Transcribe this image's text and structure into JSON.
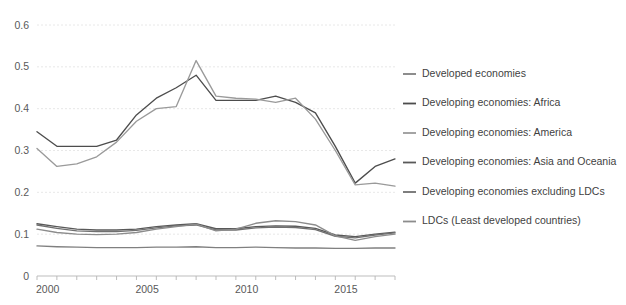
{
  "chart_data": {
    "type": "line",
    "title": "",
    "subtitle": "",
    "xlabel": "",
    "ylabel": "",
    "xlim": [
      2000,
      2018
    ],
    "ylim": [
      0,
      0.6
    ],
    "grid": true,
    "legend_position": "right",
    "x": [
      2000,
      2001,
      2002,
      2003,
      2004,
      2005,
      2006,
      2007,
      2008,
      2009,
      2010,
      2011,
      2012,
      2013,
      2014,
      2015,
      2016,
      2017,
      2018
    ],
    "y_ticks": [
      0,
      0.1,
      0.2,
      0.3,
      0.4,
      0.5,
      0.6
    ],
    "y_tick_labels": [
      "0",
      "0.1",
      "0.2",
      "0.3",
      "0.4",
      "0.5",
      "0.6"
    ],
    "x_ticks": [
      2000,
      2005,
      2010,
      2015
    ],
    "x_tick_labels": [
      "2000",
      "2005",
      "2010",
      "2015"
    ],
    "series": [
      {
        "name": "Developed economies",
        "color": "#808080",
        "values": [
          0.072,
          0.07,
          0.069,
          0.068,
          0.068,
          0.068,
          0.069,
          0.069,
          0.07,
          0.068,
          0.068,
          0.069,
          0.068,
          0.067,
          0.067,
          0.066,
          0.066,
          0.067,
          0.067
        ]
      },
      {
        "name": "Developing economies: Africa",
        "color": "#4d4d4d",
        "values": [
          0.345,
          0.31,
          0.31,
          0.31,
          0.325,
          0.385,
          0.425,
          0.45,
          0.48,
          0.42,
          0.42,
          0.42,
          0.43,
          0.415,
          0.39,
          0.31,
          0.222,
          0.262,
          0.28
        ]
      },
      {
        "name": "Developing economies: America",
        "color": "#9a9a9a",
        "values": [
          0.305,
          0.262,
          0.268,
          0.285,
          0.32,
          0.37,
          0.4,
          0.405,
          0.515,
          0.43,
          0.425,
          0.423,
          0.415,
          0.425,
          0.375,
          0.3,
          0.218,
          0.222,
          0.215
        ]
      },
      {
        "name": "Developing economies: Asia and Oceania",
        "color": "#595959",
        "values": [
          0.125,
          0.118,
          0.112,
          0.11,
          0.11,
          0.112,
          0.118,
          0.122,
          0.125,
          0.113,
          0.113,
          0.118,
          0.12,
          0.119,
          0.114,
          0.098,
          0.094,
          0.1,
          0.105
        ]
      },
      {
        "name": "Developing economies excluding LDCs",
        "color": "#707070",
        "values": [
          0.122,
          0.114,
          0.108,
          0.106,
          0.106,
          0.109,
          0.115,
          0.12,
          0.122,
          0.11,
          0.11,
          0.115,
          0.117,
          0.116,
          0.111,
          0.095,
          0.091,
          0.098,
          0.103
        ]
      },
      {
        "name": "LDCs (Least developed countries)",
        "color": "#8c8c8c",
        "values": [
          0.112,
          0.104,
          0.1,
          0.099,
          0.1,
          0.104,
          0.112,
          0.118,
          0.124,
          0.108,
          0.112,
          0.126,
          0.132,
          0.13,
          0.122,
          0.096,
          0.085,
          0.094,
          0.1
        ]
      }
    ]
  },
  "legend": {
    "items": [
      {
        "label": "Developed economies"
      },
      {
        "label": "Developing economies: Africa"
      },
      {
        "label": "Developing economies: America"
      },
      {
        "label": "Developing economies: Asia and Oceania"
      },
      {
        "label": "Developing economies excluding LDCs"
      },
      {
        "label": "LDCs (Least developed countries)"
      }
    ]
  }
}
